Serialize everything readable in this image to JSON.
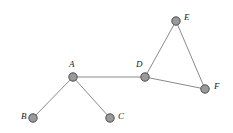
{
  "figure": {
    "background_color": "#ffffff",
    "node_fill_color": "#9a9a9a",
    "node_stroke_color": "#4d4d4d",
    "edge_color": "#8a8a8a",
    "label_color": "#1a1a1a",
    "node_radius": 4.2
  },
  "chart_data": {
    "type": "diagram",
    "title": "",
    "nodes": [
      {
        "id": "A",
        "label": "A",
        "x": 73,
        "y": 77,
        "label_x": 69,
        "label_y": 60
      },
      {
        "id": "B",
        "label": "B",
        "x": 33,
        "y": 118,
        "label_x": 21,
        "label_y": 112
      },
      {
        "id": "C",
        "label": "C",
        "x": 110,
        "y": 118,
        "label_x": 118,
        "label_y": 112
      },
      {
        "id": "D",
        "label": "D",
        "x": 145,
        "y": 77,
        "label_x": 136,
        "label_y": 60
      },
      {
        "id": "E",
        "label": "E",
        "x": 176,
        "y": 21,
        "label_x": 184,
        "label_y": 13
      },
      {
        "id": "F",
        "label": "F",
        "x": 205,
        "y": 89,
        "label_x": 214,
        "label_y": 82
      }
    ],
    "edges": [
      {
        "from": "A",
        "to": "B"
      },
      {
        "from": "A",
        "to": "C"
      },
      {
        "from": "A",
        "to": "D"
      },
      {
        "from": "D",
        "to": "E"
      },
      {
        "from": "D",
        "to": "F"
      },
      {
        "from": "E",
        "to": "F"
      }
    ]
  }
}
